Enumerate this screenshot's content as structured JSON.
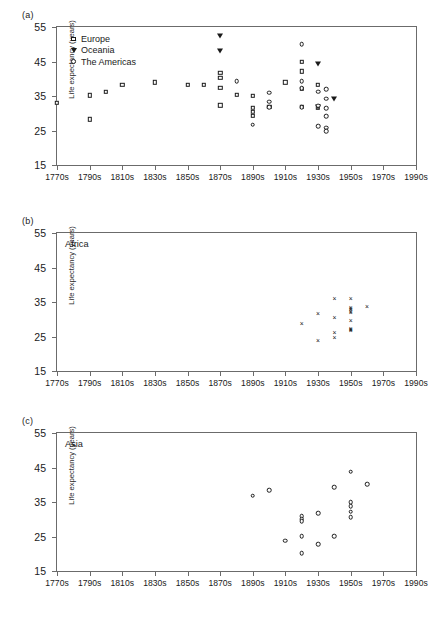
{
  "figure": {
    "ylabel": "Life expectancy (years)",
    "yticks": [
      "15",
      "25",
      "35",
      "45",
      "55"
    ],
    "xticks": [
      "1770s",
      "1790s",
      "1810s",
      "1830s",
      "1850s",
      "1870s",
      "1890s",
      "1910s",
      "1930s",
      "1950s",
      "1970s",
      "1990s"
    ],
    "panels": [
      {
        "letter": "(a)",
        "caption": ""
      },
      {
        "letter": "(b)",
        "caption": "Africa"
      },
      {
        "letter": "(c)",
        "caption": "Asia"
      }
    ],
    "legend": [
      {
        "label": "Europe",
        "marker": "square-icon"
      },
      {
        "label": "Oceania",
        "marker": "triangle-down-icon"
      },
      {
        "label": "The Americas",
        "marker": "circle-icon"
      }
    ],
    "caption_note": ""
  },
  "chart_data": [
    {
      "type": "scatter",
      "panel": "(a)",
      "title": "",
      "xlabel": "",
      "ylabel": "Life expectancy (years)",
      "xlim": [
        1770,
        1990
      ],
      "ylim": [
        15,
        55
      ],
      "xtick_labels": [
        "1770s",
        "1790s",
        "1810s",
        "1830s",
        "1850s",
        "1870s",
        "1890s",
        "1910s",
        "1930s",
        "1950s",
        "1970s",
        "1990s"
      ],
      "ytick_values": [
        15,
        25,
        35,
        45,
        55
      ],
      "grid": false,
      "legend_position": "top-left-inside",
      "series": [
        {
          "name": "Europe",
          "marker": "square",
          "points": [
            [
              1770,
              33.0
            ],
            [
              1790,
              35.2
            ],
            [
              1790,
              28.2
            ],
            [
              1800,
              36.2
            ],
            [
              1810,
              38.2
            ],
            [
              1830,
              39.0
            ],
            [
              1850,
              38.2
            ],
            [
              1860,
              38.2
            ],
            [
              1870,
              41.8
            ],
            [
              1870,
              40.2
            ],
            [
              1870,
              37.3
            ],
            [
              1870,
              32.3
            ],
            [
              1880,
              35.4
            ],
            [
              1890,
              35.0
            ],
            [
              1890,
              31.5
            ],
            [
              1890,
              30.5
            ],
            [
              1890,
              29.3
            ],
            [
              1900,
              31.8
            ],
            [
              1910,
              39.0
            ],
            [
              1920,
              44.9
            ],
            [
              1920,
              42.2
            ],
            [
              1920,
              37.0
            ],
            [
              1920,
              31.8
            ],
            [
              1930,
              38.2
            ],
            [
              1930,
              31.5
            ]
          ]
        },
        {
          "name": "Oceania",
          "marker": "triangle-down",
          "points": [
            [
              1870,
              52.5
            ],
            [
              1870,
              48.0
            ],
            [
              1930,
              44.3
            ],
            [
              1930,
              31.8
            ],
            [
              1940,
              34.0
            ]
          ]
        },
        {
          "name": "The Americas",
          "marker": "circle",
          "points": [
            [
              1880,
              39.3
            ],
            [
              1890,
              26.7
            ],
            [
              1900,
              36.0
            ],
            [
              1900,
              33.3
            ],
            [
              1900,
              31.8
            ],
            [
              1920,
              50.0
            ],
            [
              1920,
              39.3
            ],
            [
              1920,
              37.2
            ],
            [
              1920,
              31.8
            ],
            [
              1930,
              36.2
            ],
            [
              1930,
              32.2
            ],
            [
              1930,
              26.2
            ],
            [
              1935,
              37.0
            ],
            [
              1935,
              34.2
            ],
            [
              1935,
              31.5
            ],
            [
              1935,
              29.2
            ],
            [
              1935,
              25.8
            ],
            [
              1935,
              24.8
            ]
          ]
        }
      ]
    },
    {
      "type": "scatter",
      "panel": "(b)",
      "title": "Africa",
      "xlabel": "",
      "ylabel": "Life expectancy (years)",
      "xlim": [
        1770,
        1990
      ],
      "ylim": [
        15,
        55
      ],
      "xtick_labels": [
        "1770s",
        "1790s",
        "1810s",
        "1830s",
        "1850s",
        "1870s",
        "1890s",
        "1910s",
        "1930s",
        "1950s",
        "1970s",
        "1990s"
      ],
      "ytick_values": [
        15,
        25,
        35,
        45,
        55
      ],
      "grid": false,
      "legend_position": "none",
      "series": [
        {
          "name": "Africa",
          "marker": "cross",
          "points": [
            [
              1920,
              28.5
            ],
            [
              1930,
              31.5
            ],
            [
              1930,
              23.8
            ],
            [
              1940,
              35.8
            ],
            [
              1940,
              30.5
            ],
            [
              1940,
              26.0
            ],
            [
              1940,
              24.7
            ],
            [
              1950,
              36.0
            ],
            [
              1950,
              33.4
            ],
            [
              1950,
              33.0
            ],
            [
              1950,
              32.6
            ],
            [
              1950,
              32.2
            ],
            [
              1950,
              31.8
            ],
            [
              1950,
              29.4
            ],
            [
              1950,
              27.2
            ],
            [
              1950,
              27.0
            ],
            [
              1950,
              26.8
            ],
            [
              1950,
              26.5
            ],
            [
              1960,
              33.5
            ]
          ]
        }
      ]
    },
    {
      "type": "scatter",
      "panel": "(c)",
      "title": "Asia",
      "xlabel": "",
      "ylabel": "Life expectancy (years)",
      "xlim": [
        1770,
        1990
      ],
      "ylim": [
        15,
        55
      ],
      "xtick_labels": [
        "1770s",
        "1790s",
        "1810s",
        "1830s",
        "1850s",
        "1870s",
        "1890s",
        "1910s",
        "1930s",
        "1950s",
        "1970s",
        "1990s"
      ],
      "ytick_values": [
        15,
        25,
        35,
        45,
        55
      ],
      "grid": false,
      "legend_position": "none",
      "series": [
        {
          "name": "Asia",
          "marker": "circle",
          "points": [
            [
              1890,
              36.8
            ],
            [
              1900,
              38.5
            ],
            [
              1910,
              23.8
            ],
            [
              1920,
              30.8
            ],
            [
              1920,
              30.0
            ],
            [
              1920,
              29.4
            ],
            [
              1920,
              25.1
            ],
            [
              1920,
              20.2
            ],
            [
              1930,
              31.8
            ],
            [
              1930,
              22.8
            ],
            [
              1940,
              39.3
            ],
            [
              1940,
              25.1
            ],
            [
              1950,
              43.8
            ],
            [
              1950,
              35.0
            ],
            [
              1950,
              33.8
            ],
            [
              1950,
              32.2
            ],
            [
              1950,
              30.6
            ],
            [
              1960,
              40.2
            ]
          ]
        }
      ]
    }
  ]
}
